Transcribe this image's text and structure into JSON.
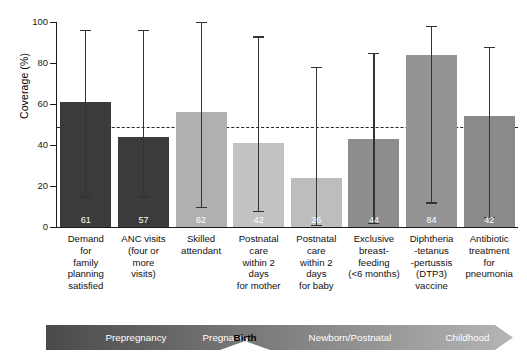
{
  "chart_data": {
    "type": "bar",
    "title": "",
    "xlabel": "",
    "ylabel": "Coverage (%)",
    "ylim": [
      0,
      100
    ],
    "yticks": [
      0,
      20,
      40,
      60,
      80,
      100
    ],
    "grid": false,
    "legend": "none",
    "reference_line": {
      "value": 49,
      "style": "dashed",
      "label": ""
    },
    "categories": [
      "Demand for family planning satisfied",
      "ANC visits (four or more visits)",
      "Skilled attendant",
      "Postnatal care within 2 days for mother",
      "Postnatal care within 2 days for baby",
      "Exclusive breast-feeding (<6 months)",
      "Diphtheria -tetanus -pertussis (DTP3) vaccine",
      "Antibiotic treatment for pneumonia"
    ],
    "values": [
      61,
      44,
      56,
      41,
      24,
      43,
      84,
      54
    ],
    "data_labels": [
      61,
      57,
      62,
      42,
      26,
      44,
      84,
      42
    ],
    "error_low": [
      15,
      15,
      10,
      8,
      1,
      2,
      12,
      5
    ],
    "error_high": [
      96,
      96,
      100,
      93,
      78,
      85,
      98,
      88
    ],
    "bar_colors": [
      "#3b3b3b",
      "#3b3b3b",
      "#b0b0b0",
      "#c2c2c2",
      "#bdbdbd",
      "#8d8d8d",
      "#949494",
      "#8a8a8a"
    ]
  },
  "axis": {
    "y_title": "Coverage (%)",
    "y_tick_labels": [
      "100",
      "80",
      "60",
      "40",
      "20",
      "0"
    ]
  },
  "categories_lines": [
    [
      "Demand",
      "for",
      "family",
      "planning",
      "satisfied"
    ],
    [
      "ANC visits",
      "(four or",
      "more",
      "visits)"
    ],
    [
      "Skilled",
      "attendant"
    ],
    [
      "Postnatal",
      "care",
      "within 2",
      "days",
      "for mother"
    ],
    [
      "Postnatal",
      "care",
      "within 2",
      "days",
      "for baby"
    ],
    [
      "Exclusive",
      "breast-",
      "feeding",
      "(<6 months)"
    ],
    [
      "Diphtheria",
      "-tetanus",
      "-pertussis",
      "(DTP3)",
      "vaccine"
    ],
    [
      "Antibiotic",
      "treatment",
      "for",
      "pneumonia"
    ]
  ],
  "timeline": {
    "stages": [
      {
        "label": "Prepregnancy"
      },
      {
        "label": "Pregnancy"
      },
      {
        "label": "Birth"
      },
      {
        "label": "Newborn/Postnatal"
      },
      {
        "label": "Childhood"
      }
    ],
    "gradient_start": "#4a4a4a",
    "gradient_end": "#b5b5b5"
  }
}
